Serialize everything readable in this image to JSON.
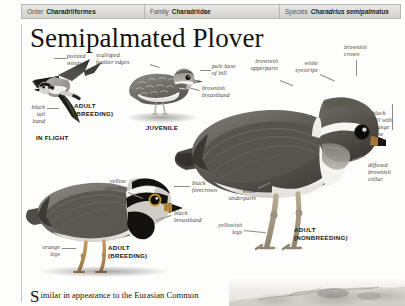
{
  "taxonomy": [
    {
      "key": "Order",
      "value": "Charadriiformes",
      "italic": false
    },
    {
      "key": "Family",
      "value": "Charadriidae",
      "italic": false
    },
    {
      "key": "Species",
      "value": "Charadrius semipalmatus",
      "italic": true
    }
  ],
  "title": "Semipalmated Plover",
  "figures": {
    "in_flight": {
      "caption": "ADULT\n(BREEDING)",
      "sub_caption": "IN FLIGHT"
    },
    "juvenile": {
      "caption": "JUVENILE"
    },
    "nonbreeding": {
      "caption": "ADULT\n(NONBREEDING)"
    },
    "breeding": {
      "caption": "ADULT\n(BREEDING)"
    }
  },
  "callouts": {
    "pointed_wings": "pointed\nwings",
    "black_tail_band": "black\ntail\nband",
    "scalloped_edges": "scalloped\nfeather edges",
    "pale_base_of_bill": "pale base\nof bill",
    "brownish_breastband": "brownish\nbreastband",
    "brownish_upperparts": "brownish\nupperparts",
    "white_eyestripe": "white\neyestripe",
    "brownish_crown": "brownish\ncrown",
    "black_bill_orange": "black\nbill with\norange\nbase",
    "diffused_collar": "diffused\nbrownish\ncollar",
    "white_underparts": "white\nunderparts",
    "yellowish_legs": "yellowish\nlegs",
    "yellow_eyering": "yellow\neye-ring",
    "black_forecrown": "black\nforecrown",
    "black_breastband": "black\nbreastband",
    "orange_legs": "orange\nlegs"
  },
  "body": {
    "dropcap": "S",
    "text": "imilar in appearance to the Eurasian Common"
  },
  "colors": {
    "header_bg": "#dedcd7",
    "header_border": "#b9b7b1",
    "ink": "#17160f",
    "label_ink": "#4a4843",
    "rule": "#c8c6c0"
  }
}
